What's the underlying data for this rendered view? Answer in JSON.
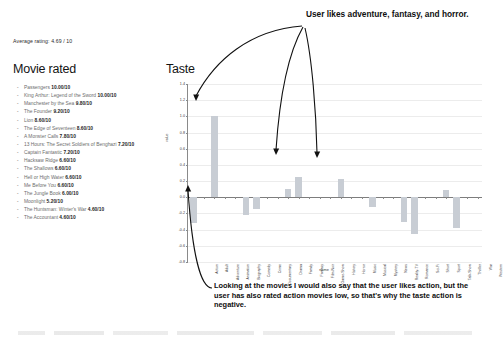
{
  "average_rating_text": "Average rating: 4.69 / 10",
  "movies": {
    "heading": "Movie rated",
    "items": [
      {
        "title": "Passengers",
        "score": "10.00/10"
      },
      {
        "title": "King Arthur: Legend of the Sword",
        "score": "10.00/10"
      },
      {
        "title": "Manchester by the Sea",
        "score": "9.80/10"
      },
      {
        "title": "The Founder",
        "score": "9.20/10"
      },
      {
        "title": "Lion",
        "score": "8.60/10"
      },
      {
        "title": "The Edge of Seventeen",
        "score": "8.60/10"
      },
      {
        "title": "A Monster Calls",
        "score": "7.80/10"
      },
      {
        "title": "13 Hours: The Secret Soldiers of Benghazi",
        "score": "7.20/10"
      },
      {
        "title": "Captain Fantastic",
        "score": "7.20/10"
      },
      {
        "title": "Hacksaw Ridge",
        "score": "6.60/10"
      },
      {
        "title": "The Shallows",
        "score": "6.60/10"
      },
      {
        "title": "Hell or High Water",
        "score": "6.60/10"
      },
      {
        "title": "Me Before You",
        "score": "6.60/10"
      },
      {
        "title": "The Jungle Book",
        "score": "6.00/10"
      },
      {
        "title": "Moonlight",
        "score": "5.20/10"
      },
      {
        "title": "The Huntsman: Winter's War",
        "score": "4.60/10"
      },
      {
        "title": "The Accountant",
        "score": "4.60/10"
      }
    ]
  },
  "chart_data": {
    "type": "bar",
    "title": "Taste",
    "xlabel": "name",
    "ylabel": "value",
    "ylim": [
      -0.8,
      1.4
    ],
    "yticks": [
      -0.8,
      -0.6,
      -0.4,
      -0.2,
      0.0,
      0.2,
      0.4,
      0.6,
      0.8,
      1.0,
      1.2,
      1.4
    ],
    "ytick_labels": [
      "-0.8",
      "-0.6",
      "-0.4",
      "-0.2",
      "0.0",
      "0.2",
      "0.4",
      "0.6",
      "0.8",
      "1.0",
      "1.2",
      "1.4"
    ],
    "grid": true,
    "legend": "none",
    "categories": [
      "Action",
      "Adult",
      "Adventure",
      "Animation",
      "Biography",
      "Comedy",
      "Crime",
      "Documentary",
      "Drama",
      "Family",
      "Fantasy",
      "Film-Noir",
      "Game-Show",
      "History",
      "Horror",
      "Music",
      "Musical",
      "Mystery",
      "News",
      "Reality-TV",
      "Romance",
      "Sci-Fi",
      "Short",
      "Sport",
      "Talk-Show",
      "Thriller",
      "War",
      "Western"
    ],
    "values": [
      -0.32,
      0.0,
      1.0,
      0.0,
      0.0,
      -0.22,
      -0.15,
      0.0,
      0.0,
      0.1,
      0.25,
      0.0,
      0.0,
      0.0,
      0.22,
      0.0,
      0.0,
      -0.12,
      0.0,
      0.0,
      -0.3,
      -0.45,
      0.0,
      0.0,
      0.09,
      -0.38,
      0.0,
      0.0
    ]
  },
  "annotations": {
    "top": "User likes adventure, fantasy, and horror.",
    "bottom": "Looking at the movies I would also say that the user likes action, but the user has also rated action movies low, so that's why the taste action is negative."
  }
}
